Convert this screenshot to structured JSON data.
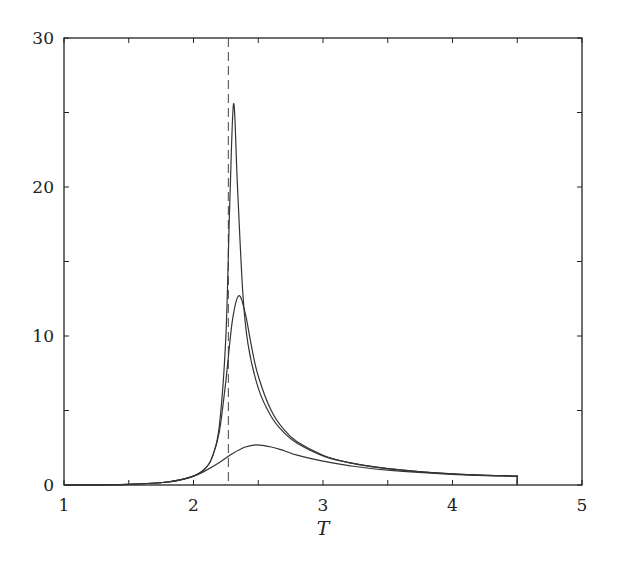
{
  "chart_data": {
    "type": "line",
    "title": "",
    "xlabel": "T",
    "ylabel": "",
    "xlim": [
      1,
      5
    ],
    "ylim": [
      0,
      30
    ],
    "x_ticks": [
      1,
      2,
      3,
      4,
      5
    ],
    "y_ticks": [
      0,
      10,
      20,
      30
    ],
    "x_minor_ticks": [
      1.5,
      2.5,
      3.5,
      4.5
    ],
    "y_minor_ticks": [
      5,
      15,
      25
    ],
    "grid": false,
    "legend": null,
    "annotations": [
      {
        "type": "vertical-dashed-line",
        "x": 2.269,
        "label": ""
      }
    ],
    "series": [
      {
        "name": "curve-high-peak",
        "x": [
          1.0,
          1.5,
          1.8,
          2.0,
          2.1,
          2.15,
          2.2,
          2.25,
          2.28,
          2.31,
          2.34,
          2.38,
          2.42,
          2.5,
          2.6,
          2.7,
          2.8,
          3.0,
          3.2,
          3.5,
          4.0,
          4.5
        ],
        "y": [
          0.0,
          0.05,
          0.2,
          0.6,
          1.2,
          2.0,
          4.0,
          10.0,
          19.0,
          25.6,
          20.0,
          13.0,
          9.5,
          6.5,
          4.6,
          3.5,
          2.8,
          1.95,
          1.5,
          1.1,
          0.75,
          0.6
        ]
      },
      {
        "name": "curve-mid-peak",
        "x": [
          1.0,
          1.5,
          1.8,
          2.0,
          2.1,
          2.15,
          2.2,
          2.25,
          2.3,
          2.35,
          2.4,
          2.45,
          2.5,
          2.6,
          2.7,
          2.8,
          3.0,
          3.2,
          3.5,
          4.0,
          4.5
        ],
        "y": [
          0.0,
          0.05,
          0.2,
          0.6,
          1.2,
          2.0,
          3.6,
          7.0,
          11.0,
          12.7,
          11.5,
          9.2,
          7.3,
          5.0,
          3.7,
          2.9,
          2.0,
          1.5,
          1.1,
          0.75,
          0.6
        ]
      },
      {
        "name": "curve-low-peak",
        "x": [
          1.0,
          1.5,
          1.8,
          2.0,
          2.1,
          2.2,
          2.3,
          2.4,
          2.49,
          2.6,
          2.7,
          2.8,
          3.0,
          3.2,
          3.5,
          4.0,
          4.5
        ],
        "y": [
          0.0,
          0.05,
          0.2,
          0.6,
          1.0,
          1.5,
          2.1,
          2.55,
          2.7,
          2.55,
          2.3,
          2.0,
          1.6,
          1.3,
          1.0,
          0.72,
          0.58
        ]
      }
    ]
  },
  "axes": {
    "x_label": "T",
    "x_tick_labels": [
      "1",
      "2",
      "3",
      "4",
      "5"
    ],
    "y_tick_labels": [
      "0",
      "10",
      "20",
      "30"
    ]
  }
}
